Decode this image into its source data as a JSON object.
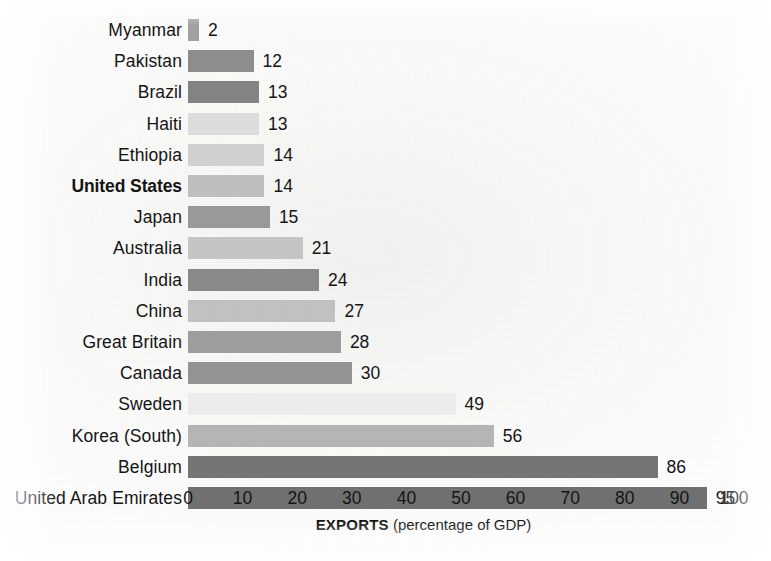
{
  "chart_data": {
    "type": "bar",
    "orientation": "horizontal",
    "title": "",
    "xlabel": "EXPORTS (percentage of GDP)",
    "xlabel_bold_part": "EXPORTS",
    "xlabel_regular_part": "(percentage of GDP)",
    "ylabel": "",
    "xlim": [
      0,
      100
    ],
    "xticks": [
      0,
      10,
      20,
      30,
      40,
      50,
      60,
      70,
      80,
      90,
      100
    ],
    "xtick_labels": [
      "0",
      "10",
      "20",
      "30",
      "40",
      "50",
      "60",
      "70",
      "80",
      "90",
      "100"
    ],
    "grid": false,
    "legend": false,
    "value_labels_shown": true,
    "categories": [
      "Myanmar",
      "Pakistan",
      "Brazil",
      "Haiti",
      "Ethiopia",
      "United States",
      "Japan",
      "Australia",
      "India",
      "China",
      "Great Britain",
      "Canada",
      "Sweden",
      "Korea (South)",
      "Belgium",
      "United Arab Emirates"
    ],
    "values": [
      2,
      12,
      13,
      13,
      14,
      14,
      15,
      21,
      24,
      27,
      28,
      30,
      49,
      56,
      86,
      95
    ],
    "highlighted_category": "United States",
    "bar_colors": [
      "#a2a2a2",
      "#8e8e8e",
      "#848484",
      "#dedede",
      "#d2d2d2",
      "#c0c0c0",
      "#9a9a9a",
      "#c6c6c6",
      "#8a8a8a",
      "#c2c2c2",
      "#9e9e9e",
      "#949494",
      "#eeeeee",
      "#b6b6b6",
      "#767676",
      "#717171"
    ]
  },
  "rows": [
    {
      "label": "Myanmar",
      "value": "2",
      "v": 2,
      "color": "#a2a2a2",
      "bold": false
    },
    {
      "label": "Pakistan",
      "value": "12",
      "v": 12,
      "color": "#8e8e8e",
      "bold": false
    },
    {
      "label": "Brazil",
      "value": "13",
      "v": 13,
      "color": "#848484",
      "bold": false
    },
    {
      "label": "Haiti",
      "value": "13",
      "v": 13,
      "color": "#dedede",
      "bold": false
    },
    {
      "label": "Ethiopia",
      "value": "14",
      "v": 14,
      "color": "#d2d2d2",
      "bold": false
    },
    {
      "label": "United States",
      "value": "14",
      "v": 14,
      "color": "#c0c0c0",
      "bold": true
    },
    {
      "label": "Japan",
      "value": "15",
      "v": 15,
      "color": "#9a9a9a",
      "bold": false
    },
    {
      "label": "Australia",
      "value": "21",
      "v": 21,
      "color": "#c6c6c6",
      "bold": false
    },
    {
      "label": "India",
      "value": "24",
      "v": 24,
      "color": "#8a8a8a",
      "bold": false
    },
    {
      "label": "China",
      "value": "27",
      "v": 27,
      "color": "#c2c2c2",
      "bold": false
    },
    {
      "label": "Great Britain",
      "value": "28",
      "v": 28,
      "color": "#9e9e9e",
      "bold": false
    },
    {
      "label": "Canada",
      "value": "30",
      "v": 30,
      "color": "#949494",
      "bold": false
    },
    {
      "label": "Sweden",
      "value": "49",
      "v": 49,
      "color": "#eeeeee",
      "bold": false
    },
    {
      "label": "Korea (South)",
      "value": "56",
      "v": 56,
      "color": "#b6b6b6",
      "bold": false
    },
    {
      "label": "Belgium",
      "value": "86",
      "v": 86,
      "color": "#767676",
      "bold": false
    },
    {
      "label": "United Arab Emirates",
      "value": "95",
      "v": 95,
      "color": "#717171",
      "bold": false
    }
  ],
  "axis": {
    "ticks": [
      "0",
      "10",
      "20",
      "30",
      "40",
      "50",
      "60",
      "70",
      "80",
      "90",
      "100"
    ],
    "title_bold": "EXPORTS",
    "title_rest": "(percentage of GDP)"
  }
}
